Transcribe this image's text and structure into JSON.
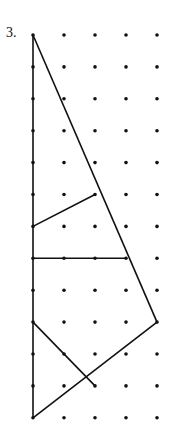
{
  "problem_label": "3.",
  "grid": {
    "cols": 5,
    "rows": 13,
    "x0": 33,
    "y0": 35,
    "dx": 31,
    "dy": 31.9
  },
  "segments": [
    [
      [
        0,
        0
      ],
      [
        0,
        12
      ]
    ],
    [
      [
        0,
        0
      ],
      [
        4,
        9
      ]
    ],
    [
      [
        0,
        6
      ],
      [
        2,
        5
      ]
    ],
    [
      [
        0,
        7
      ],
      [
        3,
        7
      ]
    ],
    [
      [
        4,
        9
      ],
      [
        0,
        12
      ]
    ],
    [
      [
        0,
        9
      ],
      [
        2,
        11
      ]
    ]
  ],
  "colors": {
    "ink": "#111111"
  }
}
